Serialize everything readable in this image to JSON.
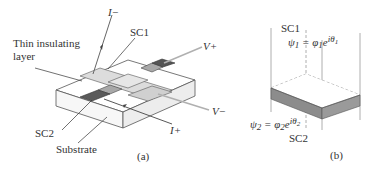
{
  "figure_a": {
    "caption": "(a)",
    "labels": {
      "i_minus": "I−",
      "i_plus": "I+",
      "v_plus": "V+",
      "v_minus": "V−",
      "sc1": "SC1",
      "sc2": "SC2",
      "insulating_line1": "Thin insulating",
      "insulating_line2": "layer",
      "substrate": "Substrate"
    }
  },
  "figure_b": {
    "caption": "(b)",
    "labels": {
      "sc1": "SC1",
      "sc2": "SC2",
      "psi1_lhs": "ψ",
      "psi1_sub": "1",
      "psi1_eq": " = φ",
      "psi1_phi_sub": "1",
      "psi1_e": "e",
      "psi1_exp": "iθ",
      "psi1_exp_sub": "1",
      "psi2_lhs": "ψ",
      "psi2_sub": "2",
      "psi2_eq": " = φ",
      "psi2_phi_sub": "2",
      "psi2_e": "e",
      "psi2_exp": "iθ",
      "psi2_exp_sub": "2"
    }
  },
  "colors": {
    "sc1_film": "#d9d9d9",
    "sc2_film": "#6e6e6e",
    "contact_mid": "#a8a8a8",
    "barrier_band": "#8f8f8f",
    "lines": "#555555",
    "lead_gray": "#b0b0b0"
  }
}
